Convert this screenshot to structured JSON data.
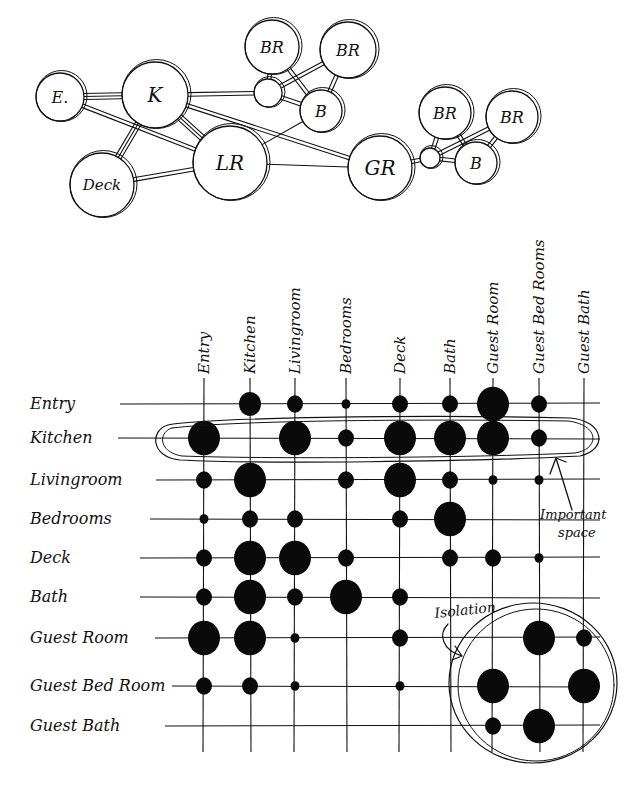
{
  "bubble_diagram": {
    "title": "",
    "nodes": [
      {
        "id": "E",
        "label": "E.",
        "x": 60,
        "y": 97,
        "r": 24
      },
      {
        "id": "K",
        "label": "K",
        "x": 155,
        "y": 95,
        "r": 33
      },
      {
        "id": "Deck",
        "label": "Deck",
        "x": 102,
        "y": 185,
        "r": 32
      },
      {
        "id": "LR",
        "label": "LR",
        "x": 230,
        "y": 163,
        "r": 37
      },
      {
        "id": "H1",
        "label": "",
        "x": 268,
        "y": 93,
        "r": 14
      },
      {
        "id": "BR1",
        "label": "BR",
        "x": 272,
        "y": 47,
        "r": 27
      },
      {
        "id": "BR2",
        "label": "BR",
        "x": 348,
        "y": 50,
        "r": 28
      },
      {
        "id": "B1",
        "label": "B",
        "x": 321,
        "y": 111,
        "r": 21
      },
      {
        "id": "GR",
        "label": "GR",
        "x": 380,
        "y": 168,
        "r": 32
      },
      {
        "id": "H2",
        "label": "",
        "x": 430,
        "y": 158,
        "r": 10
      },
      {
        "id": "GBR1",
        "label": "BR",
        "x": 445,
        "y": 113,
        "r": 26
      },
      {
        "id": "GBR2",
        "label": "BR",
        "x": 512,
        "y": 117,
        "r": 26
      },
      {
        "id": "GB",
        "label": "B",
        "x": 476,
        "y": 163,
        "r": 21
      }
    ],
    "edges": [
      {
        "from": "E",
        "to": "K",
        "style": "triple"
      },
      {
        "from": "E",
        "to": "LR",
        "style": "double"
      },
      {
        "from": "K",
        "to": "Deck",
        "style": "triple"
      },
      {
        "from": "K",
        "to": "LR",
        "style": "triple"
      },
      {
        "from": "K",
        "to": "H1",
        "style": "double"
      },
      {
        "from": "K",
        "to": "GR",
        "style": "double"
      },
      {
        "from": "Deck",
        "to": "LR",
        "style": "double"
      },
      {
        "from": "LR",
        "to": "GR",
        "style": "single"
      },
      {
        "from": "LR",
        "to": "B1",
        "style": "single"
      },
      {
        "from": "H1",
        "to": "BR1",
        "style": "double"
      },
      {
        "from": "H1",
        "to": "BR2",
        "style": "double"
      },
      {
        "from": "H1",
        "to": "B1",
        "style": "double"
      },
      {
        "from": "BR1",
        "to": "B1",
        "style": "double"
      },
      {
        "from": "BR2",
        "to": "B1",
        "style": "double"
      },
      {
        "from": "GR",
        "to": "H2",
        "style": "double"
      },
      {
        "from": "H2",
        "to": "GBR1",
        "style": "double"
      },
      {
        "from": "H2",
        "to": "GBR2",
        "style": "double"
      },
      {
        "from": "H2",
        "to": "GB",
        "style": "double"
      },
      {
        "from": "GBR1",
        "to": "GB",
        "style": "double"
      },
      {
        "from": "GBR2",
        "to": "GB",
        "style": "double"
      }
    ]
  },
  "adjacency_matrix": {
    "columns": [
      {
        "label": "Entry",
        "x": 204
      },
      {
        "label": "Kitchen",
        "x": 250
      },
      {
        "label": "Livingroom",
        "x": 295
      },
      {
        "label": "Bedrooms",
        "x": 346
      },
      {
        "label": "Deck",
        "x": 400
      },
      {
        "label": "Bath",
        "x": 450
      },
      {
        "label": "Guest Room",
        "x": 493
      },
      {
        "label": "Guest Bed Rooms",
        "x": 539
      },
      {
        "label": "Guest Bath",
        "x": 584
      }
    ],
    "rows": [
      {
        "label": "Entry",
        "y": 404,
        "line_start": 120,
        "values": [
          0,
          3,
          2,
          1,
          2,
          2,
          4,
          2,
          0
        ]
      },
      {
        "label": "Kitchen",
        "y": 438,
        "line_start": 118,
        "values": [
          4,
          0,
          4,
          2,
          4,
          4,
          4,
          2,
          0
        ]
      },
      {
        "label": "Livingroom",
        "y": 480,
        "line_start": 156,
        "values": [
          2,
          4,
          0,
          2,
          4,
          2,
          1,
          1,
          0
        ]
      },
      {
        "label": "Bedrooms",
        "y": 519,
        "line_start": 150,
        "values": [
          1,
          2,
          2,
          0,
          2,
          4,
          0,
          0,
          0
        ]
      },
      {
        "label": "Deck",
        "y": 558,
        "line_start": 140,
        "values": [
          2,
          4,
          4,
          2,
          0,
          2,
          2,
          1,
          0
        ]
      },
      {
        "label": "Bath",
        "y": 597,
        "line_start": 140,
        "values": [
          2,
          4,
          2,
          4,
          2,
          0,
          0,
          0,
          0
        ]
      },
      {
        "label": "Guest Room",
        "y": 638,
        "line_start": 155,
        "values": [
          4,
          4,
          1,
          0,
          2,
          0,
          0,
          4,
          2
        ]
      },
      {
        "label": "Guest Bed Room",
        "y": 686,
        "line_start": 172,
        "values": [
          2,
          2,
          1,
          0,
          1,
          0,
          4,
          0,
          4
        ]
      },
      {
        "label": "Guest Bath",
        "y": 726,
        "line_start": 165,
        "values": [
          0,
          0,
          0,
          0,
          0,
          0,
          2,
          4,
          0
        ]
      }
    ],
    "dot_radius_scale": [
      0,
      4.5,
      8,
      11,
      16
    ],
    "legend_note": "Dot size indicates strength of adjacency requirement"
  },
  "annotations": [
    {
      "id": "important-space",
      "text_line1": "Important",
      "text_line2": "space",
      "x": 572,
      "y": 520
    },
    {
      "id": "isolation",
      "text": "Isolation",
      "x": 440,
      "y": 618
    }
  ],
  "colors": {
    "ink": "#111111",
    "paper": "#ffffff"
  }
}
